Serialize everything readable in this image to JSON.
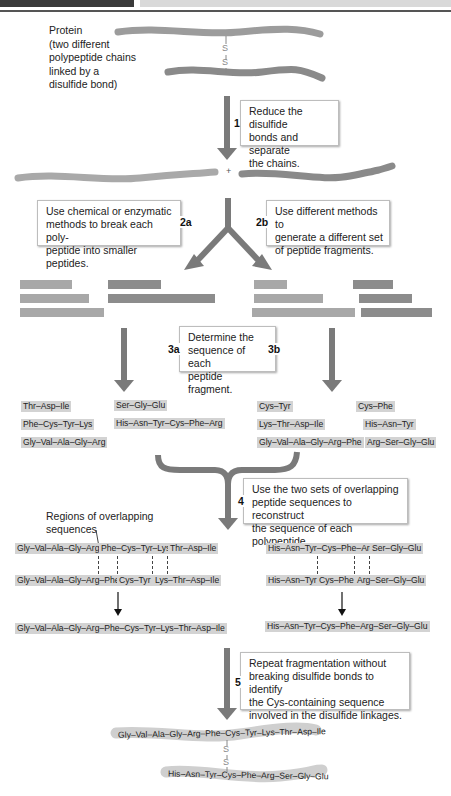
{
  "header": {
    "left_bar": "",
    "right_bar": ""
  },
  "protein": {
    "label": [
      "Protein",
      "(two different",
      "polypeptide chains",
      "linked by a",
      "disulfide bond)"
    ],
    "bond": [
      "S",
      "S"
    ]
  },
  "steps": {
    "s1": {
      "num": "1",
      "text": [
        "Reduce the disulfide",
        "bonds and separate",
        "the chains."
      ]
    },
    "s2a": {
      "num": "2a",
      "text": [
        "Use chemical or enzymatic",
        "methods to break each poly-",
        "peptide into smaller peptides."
      ]
    },
    "s2b": {
      "num": "2b",
      "text": [
        "Use different methods to",
        "generate a different set",
        "of peptide fragments."
      ]
    },
    "s3": {
      "num_a": "3a",
      "num_b": "3b",
      "text": [
        "Determine the",
        "sequence of each",
        "peptide fragment."
      ]
    },
    "s4": {
      "num": "4",
      "text": [
        "Use the two sets of overlapping",
        "peptide sequences to reconstruct",
        "the sequence of each polypeptide."
      ]
    },
    "s5": {
      "num": "5",
      "text": [
        "Repeat fragmentation without",
        "breaking disulfide bonds to identify",
        "the Cys-containing sequence",
        "involved in the disulfide linkages."
      ]
    }
  },
  "plus": "+",
  "fragments_a": {
    "chain1": [
      "Thr–Asp–Ile",
      "Phe–Cys–Tyr–Lys",
      "Gly–Val–Ala–Gly–Arg"
    ],
    "chain2": [
      "Ser–Gly–Glu",
      "His–Asn–Tyr–Cys–Phe–Arg"
    ]
  },
  "fragments_b": {
    "chain1": [
      "Cys–Tyr",
      "Lys–Thr–Asp–Ile",
      "Gly–Val–Ala–Gly–Arg–Phe"
    ],
    "chain2": [
      "Cys–Phe",
      "His–Asn–Tyr",
      "Arg–Ser–Gly–Glu"
    ]
  },
  "overlap_label": [
    "Regions of overlapping",
    "sequences"
  ],
  "alignment": {
    "chain1_top": [
      "Gly–Val–Ala–Gly–Arg",
      "Phe–Cys–Tyr–Lys",
      "Thr–Asp–Ile"
    ],
    "chain1_bottom": [
      "Gly–Val–Ala–Gly–Arg–Phe",
      "Cys–Tyr",
      "Lys–Thr–Asp–Ile"
    ],
    "chain2_top": [
      "His–Asn–Tyr–Cys–Phe–Arg",
      "Ser–Gly–Glu"
    ],
    "chain2_bottom": [
      "His–Asn–Tyr",
      "Cys–Phe",
      "Arg–Ser–Gly–Glu"
    ]
  },
  "results": {
    "chain1": "Gly–Val–Ala–Gly–Arg–Phe–Cys–Tyr–Lys–Thr–Asp–Ile",
    "chain2": "His–Asn–Tyr–Cys–Phe–Arg–Ser–Gly–Glu"
  },
  "final": {
    "chain1": "Gly–Val–Ala–Gly–Arg–Phe–Cys–Tyr–Lys–Thr–Asp–Ile",
    "chain2": "His–Asn–Tyr–Cys–Phe–Arg–Ser–Gly–Glu",
    "bond": [
      "S",
      "S"
    ]
  },
  "colors": {
    "arrow": "#7a7a7a",
    "chain_light": "#a9a9a9",
    "chain_dark": "#8a8a8a",
    "peptide_bg": "#d3d3d3"
  }
}
